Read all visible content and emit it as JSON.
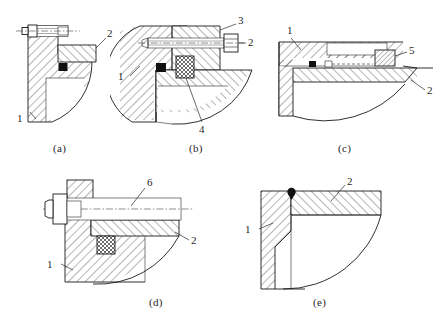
{
  "sheet": {
    "title": "",
    "background_color": "#ffffff",
    "line_color": "#1a1a1a",
    "width": 441,
    "height": 322
  },
  "figures": [
    {
      "id": "a",
      "caption": "(a)",
      "description": "bracket joined to quarter-round base by bolt through vertical flange, weld symbol at seat",
      "callouts": [
        {
          "number": "1",
          "target": "base-body"
        },
        {
          "number": "2",
          "target": "bracket-arm"
        }
      ],
      "parts": [
        "base-body",
        "bracket-arm",
        "hex-bolt",
        "weld-block"
      ]
    },
    {
      "id": "b",
      "caption": "(b)",
      "description": "round base with horizontal socket screw into boss, cross-hatched key block under joint",
      "callouts": [
        {
          "number": "1",
          "target": "base-body"
        },
        {
          "number": "2",
          "target": "socket-screw"
        },
        {
          "number": "3",
          "target": "upper-boss"
        },
        {
          "number": "4",
          "target": "key-block"
        }
      ],
      "parts": [
        "base-body",
        "upper-boss",
        "socket-screw",
        "key-block",
        "weld-block",
        "shelf-arm"
      ]
    },
    {
      "id": "c",
      "caption": "(c)",
      "description": "horizontal plate over quarter-round base with recessed slot and hatched plug at right end",
      "callouts": [
        {
          "number": "1",
          "target": "upper-plate"
        },
        {
          "number": "2",
          "target": "lower-plate"
        },
        {
          "number": "5",
          "target": "plug-insert"
        }
      ],
      "parts": [
        "upper-plate",
        "lower-plate",
        "plug-insert",
        "slot-recess",
        "weld-block"
      ]
    },
    {
      "id": "d",
      "caption": "(d)",
      "description": "long shaft through bracket with hex head at left, cross-hatched key block below arm",
      "callouts": [
        {
          "number": "1",
          "target": "base-body"
        },
        {
          "number": "2",
          "target": "bracket-arm"
        },
        {
          "number": "6",
          "target": "shaft"
        }
      ],
      "parts": [
        "base-body",
        "bracket-arm",
        "shaft",
        "hex-head",
        "key-block"
      ]
    },
    {
      "id": "e",
      "caption": "(e)",
      "description": "plain L-section bracket with quarter-round cut-away and weld dot at corner",
      "callouts": [
        {
          "number": "1",
          "target": "vertical-leg"
        },
        {
          "number": "2",
          "target": "horizontal-leg"
        }
      ],
      "parts": [
        "vertical-leg",
        "horizontal-leg",
        "weld-dot"
      ]
    }
  ],
  "captions": {
    "a": "(a)",
    "b": "(b)",
    "c": "(c)",
    "d": "(d)",
    "e": "(e)"
  },
  "callout_numbers": {
    "one": "1",
    "two": "2",
    "three": "3",
    "four": "4",
    "five": "5",
    "six": "6"
  }
}
